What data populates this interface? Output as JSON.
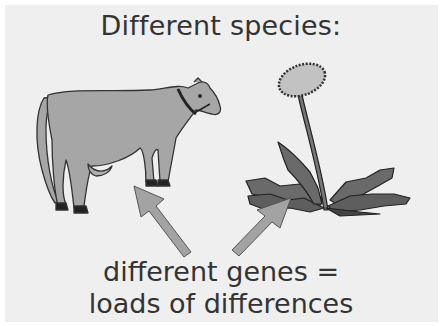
{
  "figure": {
    "title": "Different species:",
    "caption_line1": "different genes =",
    "caption_line2": "loads of differences",
    "illustrations": [
      "cow",
      "dandelion"
    ],
    "arrows": [
      "arrow-to-cow",
      "arrow-to-dandelion"
    ],
    "colors": {
      "background": "#efefef",
      "cow_fill": "#a6a6a6",
      "plant_fill": "#6a6a6a",
      "flower_head": "#c2c2c2",
      "arrow_fill": "#a3a3a3",
      "text": "#333333"
    }
  }
}
